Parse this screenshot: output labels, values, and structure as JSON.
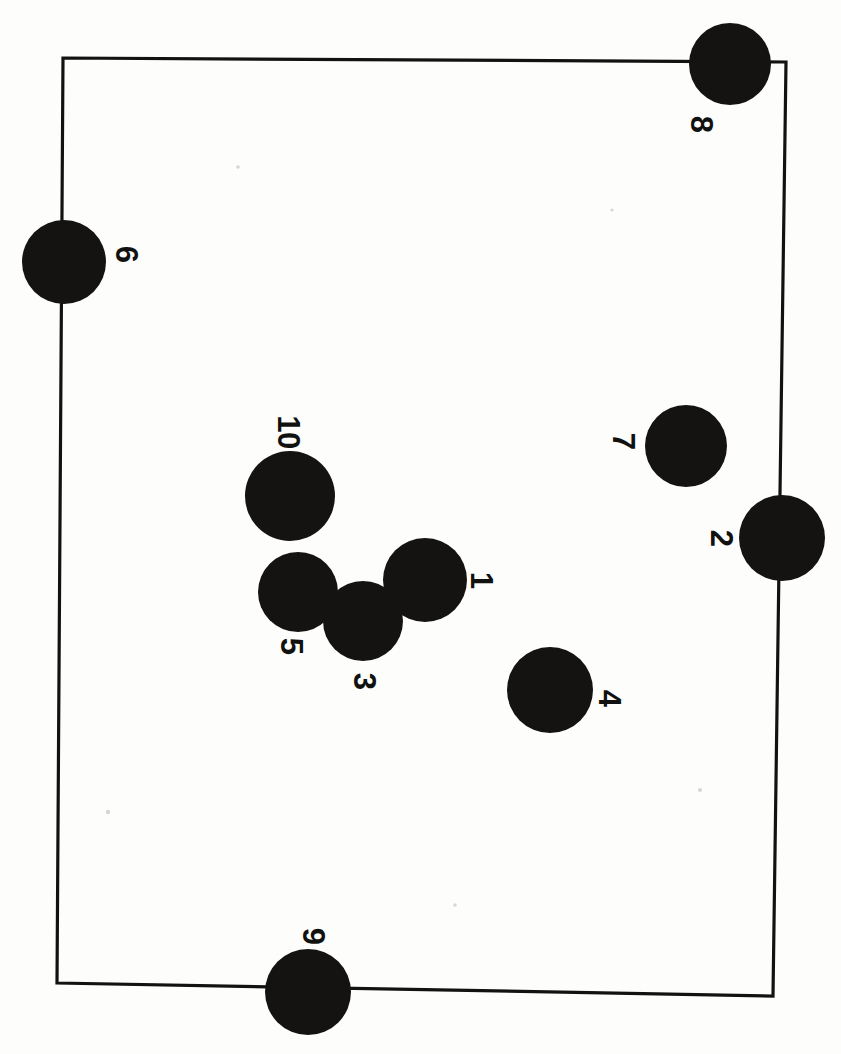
{
  "figure": {
    "orientation_note": "page rotated 90 degrees; labels read sideways",
    "background_color": "#fdfdfc",
    "ink_color": "#151311",
    "border_color": "#121210"
  },
  "field": {
    "name": "field-boundary",
    "corners": {
      "top_left": [
        63,
        58
      ],
      "top_right": [
        786,
        62
      ],
      "bottom_right": [
        773,
        996
      ],
      "bottom_left": [
        57,
        983
      ]
    },
    "stroke_width": 3.2
  },
  "chart_data": {
    "type": "scatter",
    "xlabel": "",
    "ylabel": "",
    "xlim": [
      0,
      841
    ],
    "ylim": [
      0,
      1054
    ],
    "grid": false,
    "legend": "none",
    "marker_shape": "filled-circle",
    "marker_color": "#151311",
    "points": [
      {
        "label": "1",
        "cx": 425,
        "cy": 580,
        "r": 42,
        "label_x": 481,
        "label_y": 580
      },
      {
        "label": "2",
        "cx": 782,
        "cy": 538,
        "r": 43,
        "label_x": 721,
        "label_y": 538
      },
      {
        "label": "3",
        "cx": 363,
        "cy": 621,
        "r": 40,
        "label_x": 364,
        "label_y": 681
      },
      {
        "label": "4",
        "cx": 550,
        "cy": 690,
        "r": 43,
        "label_x": 609,
        "label_y": 698
      },
      {
        "label": "5",
        "cx": 298,
        "cy": 592,
        "r": 40,
        "label_x": 291,
        "label_y": 646
      },
      {
        "label": "6",
        "cx": 64,
        "cy": 262,
        "r": 42,
        "label_x": 126,
        "label_y": 254
      },
      {
        "label": "7",
        "cx": 686,
        "cy": 446,
        "r": 41,
        "label_x": 623,
        "label_y": 441
      },
      {
        "label": "8",
        "cx": 730,
        "cy": 64,
        "r": 41,
        "label_x": 701,
        "label_y": 124
      },
      {
        "label": "9",
        "cx": 308,
        "cy": 992,
        "r": 43,
        "label_x": 313,
        "label_y": 936
      },
      {
        "label": "10",
        "cx": 290,
        "cy": 496,
        "r": 45,
        "label_x": 288,
        "label_y": 432
      }
    ]
  },
  "labels": {
    "p1": "1",
    "p2": "2",
    "p3": "3",
    "p4": "4",
    "p5": "5",
    "p6": "6",
    "p7": "7",
    "p8": "8",
    "p9": "9",
    "p10": "10"
  }
}
